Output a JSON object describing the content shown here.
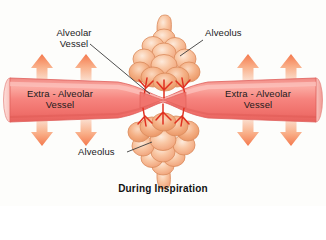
{
  "figure": {
    "title": "During Inspiration",
    "type": "biology-diagram",
    "background_color": "#fdfdfb"
  },
  "labels": {
    "alveolar_vessel": "Alveolar\nVessel",
    "alveolus_top": "Alveolus",
    "alveolus_bottom": "Alveolus",
    "extra_alveolar_vessel_left": "Extra - Alveolar\nVessel",
    "extra_alveolar_vessel_right": "Extra - Alveolar\nVessel"
  },
  "caption": "During Inspiration",
  "colors": {
    "vessel_fill": "#f4807b",
    "vessel_fill_light": "#f9a9a2",
    "vessel_edge": "#e0605c",
    "vessel_cap": "#fbc5c0",
    "alveolus_fill": "#f7b894",
    "alveolus_fill_light": "#fde2cf",
    "alveolus_outline": "#d98a5c",
    "capillary_red": "#e03020",
    "arrow_fill": "#f8a07a",
    "arrow_fill_light": "#fcd9c4",
    "leader_line": "#3b3b3b",
    "text": "#1b1b1b",
    "background": "#fdfdfb"
  },
  "arrows": {
    "description": "expansion arrows pulling extra-alveolar vessel open",
    "up_label": "up-arrow",
    "down_label": "down-arrow",
    "up_positions_x": [
      42,
      86,
      248,
      291
    ],
    "down_positions_x": [
      42,
      86,
      248,
      291
    ],
    "up_y": 62,
    "down_y": 120,
    "count_up": 4,
    "count_down": 4
  },
  "structures": {
    "alveolus_top_name": "alveolus-upper-cluster",
    "alveolus_bottom_name": "alveolus-lower-cluster",
    "vessel_name": "extra-alveolar-vessel-tube",
    "alveolar_vessel_name": "alveolar-vessel-pinch"
  }
}
